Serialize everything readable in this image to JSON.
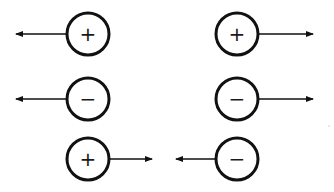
{
  "diagram": {
    "stroke_color": "#111111",
    "background": "#ffffff",
    "charges": [
      {
        "id": "c1",
        "sign": "+",
        "cx": 88,
        "cy": 34,
        "r": 21,
        "arrow_dir": "left",
        "arrow_end_x": 16
      },
      {
        "id": "c2",
        "sign": "+",
        "cx": 237,
        "cy": 34,
        "r": 21,
        "arrow_dir": "right",
        "arrow_end_x": 313
      },
      {
        "id": "c3",
        "sign": "−",
        "cx": 88,
        "cy": 99,
        "r": 21,
        "arrow_dir": "left",
        "arrow_end_x": 16
      },
      {
        "id": "c4",
        "sign": "−",
        "cx": 237,
        "cy": 99,
        "r": 21,
        "arrow_dir": "right",
        "arrow_end_x": 313
      },
      {
        "id": "c5",
        "sign": "+",
        "cx": 88,
        "cy": 159,
        "r": 21,
        "arrow_dir": "right",
        "arrow_end_x": 152
      },
      {
        "id": "c6",
        "sign": "−",
        "cx": 237,
        "cy": 159,
        "r": 21,
        "arrow_dir": "left",
        "arrow_end_x": 176
      }
    ]
  }
}
